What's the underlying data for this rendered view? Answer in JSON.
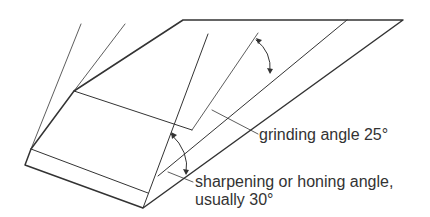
{
  "diagram": {
    "labels": {
      "grinding": "grinding angle 25°",
      "sharpening_line1": "sharpening or honing angle,",
      "sharpening_line2": "usually 30°"
    },
    "colors": {
      "line": "#333333",
      "text": "#333333",
      "background": "#ffffff"
    }
  }
}
